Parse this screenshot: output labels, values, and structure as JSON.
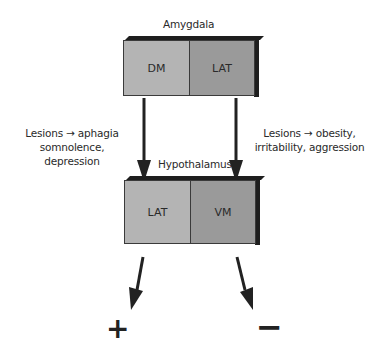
{
  "diagram": {
    "amygdala": {
      "label": "Amygdala",
      "cells": [
        {
          "label": "DM",
          "color": "#b4b4b4"
        },
        {
          "label": "LAT",
          "color": "#9a9a9a"
        }
      ]
    },
    "hypothalamus": {
      "label": "Hypothalamus",
      "cells": [
        {
          "label": "LAT",
          "color": "#b4b4b4"
        },
        {
          "label": "VM",
          "color": "#9a9a9a"
        }
      ]
    },
    "left_caption": {
      "line1": "Lesions → aphagia",
      "line2": "somnolence, depression"
    },
    "right_caption": {
      "line1": "Lesions → obesity,",
      "line2": "irritability, aggression"
    },
    "outputs": {
      "plus": "+",
      "minus": "−"
    },
    "colors": {
      "edge": "#1e1e1e",
      "light_gray": "#b4b4b4",
      "dark_gray": "#9a9a9a",
      "arrow": "#222222"
    }
  }
}
